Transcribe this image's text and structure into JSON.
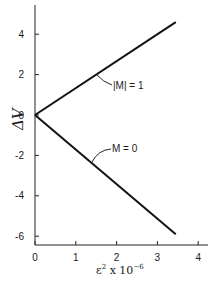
{
  "chart_data": {
    "type": "line",
    "title": "",
    "xlabel": "ε² x 10⁻⁶",
    "ylabel": "ΔV",
    "xlim": [
      0,
      4.2
    ],
    "ylim": [
      -6.5,
      5.5
    ],
    "xticks": [
      0,
      1,
      2,
      3,
      4
    ],
    "yticks": [
      4,
      2,
      0,
      -2,
      -4,
      -6
    ],
    "xtick_labels": [
      "0",
      "1",
      "2",
      "3",
      "4"
    ],
    "ytick_labels": [
      "4",
      "2",
      "0",
      "-2",
      "-4",
      "-6"
    ],
    "grid": false,
    "legend": "none (inline annotations)",
    "series": [
      {
        "name": "|M| = 1",
        "x": [
          0,
          3.45
        ],
        "y": [
          0,
          4.6
        ]
      },
      {
        "name": "M = 0",
        "x": [
          0,
          3.45
        ],
        "y": [
          0,
          -5.9
        ]
      }
    ],
    "annotations": [
      {
        "text": "|M| = 1",
        "points_to": [
          1.5,
          2.0
        ]
      },
      {
        "text": "M = 0",
        "points_to": [
          1.4,
          -2.4
        ]
      }
    ]
  },
  "labels": {
    "ylabel": "ΔV",
    "xlabel_base": "ε",
    "xlabel_sup": "2",
    "xlabel_mid": " x 10",
    "xlabel_exp": "−6",
    "annot_m1": "|M| = 1",
    "annot_m0": "M = 0"
  },
  "colors": {
    "line": "#111111",
    "axis": "#222222",
    "background": "#ffffff"
  }
}
